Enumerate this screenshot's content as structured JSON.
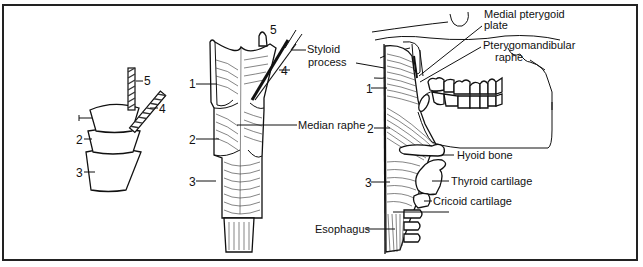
{
  "figure": {
    "panel_a": {
      "labels": [
        "1",
        "2",
        "3",
        "4",
        "5"
      ]
    },
    "panel_b": {
      "labels": [
        "1",
        "2",
        "3",
        "4",
        "5"
      ],
      "annotations": {
        "styloid_line1": "Styloid",
        "styloid_line2": "process",
        "median_raphe": "Median raphe"
      }
    },
    "panel_c": {
      "labels": [
        "1",
        "2",
        "3"
      ],
      "annotations": {
        "medial_pterygoid_line1": "Medial pterygoid",
        "medial_pterygoid_line2": "plate",
        "pterygomandibular_line1": "Pterygomandibular",
        "pterygomandibular_line2": "raphe",
        "hyoid": "Hyoid bone",
        "thyroid": "Thyroid cartilage",
        "cricoid": "Cricoid cartilage",
        "esophagus": "Esophagus"
      }
    }
  }
}
